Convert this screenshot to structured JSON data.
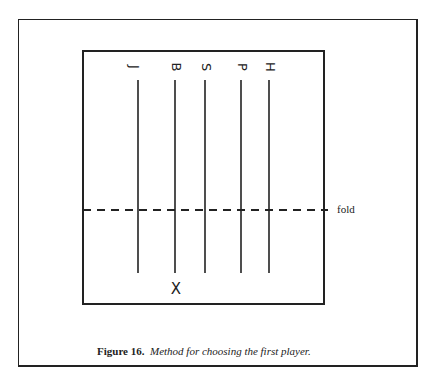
{
  "figure": {
    "caption_label": "Figure 16.",
    "caption_text": "Method for choosing the first player.",
    "fold_label": "fold",
    "players": [
      {
        "initial": "J",
        "x": 138
      },
      {
        "initial": "B",
        "x": 175
      },
      {
        "initial": "S",
        "x": 205
      },
      {
        "initial": "P",
        "x": 241
      },
      {
        "initial": "H",
        "x": 269
      }
    ],
    "mark": "X",
    "mark_under": "B"
  }
}
